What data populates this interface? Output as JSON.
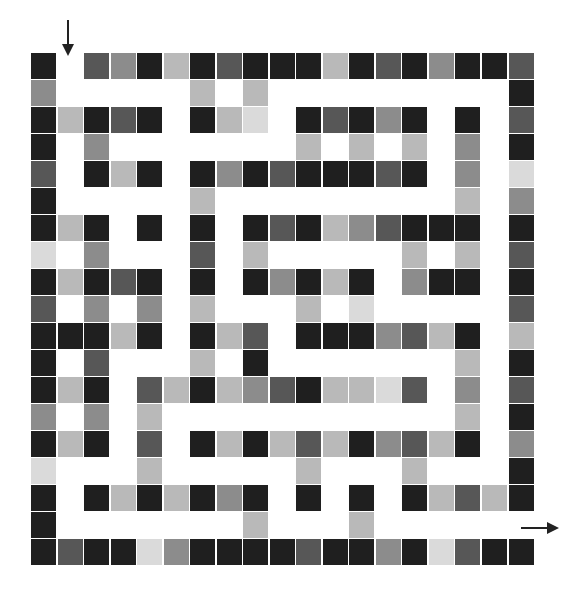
{
  "maze": {
    "rows": 19,
    "cols": 19,
    "palette": {
      "0": "#ffffff",
      "1": "#1f1f1f",
      "2": "#575757",
      "3": "#8c8c8c",
      "4": "#b9b9b9",
      "5": "#dadada"
    },
    "grid": [
      [
        1,
        0,
        2,
        3,
        1,
        4,
        1,
        2,
        1,
        1,
        1,
        4,
        1,
        2,
        1,
        3,
        1,
        1,
        2
      ],
      [
        3,
        0,
        0,
        0,
        0,
        0,
        4,
        0,
        4,
        0,
        0,
        0,
        0,
        0,
        0,
        0,
        0,
        0,
        1
      ],
      [
        1,
        4,
        1,
        2,
        1,
        0,
        1,
        4,
        5,
        0,
        1,
        2,
        1,
        3,
        1,
        0,
        1,
        0,
        2
      ],
      [
        1,
        0,
        3,
        0,
        0,
        0,
        0,
        0,
        0,
        0,
        4,
        0,
        4,
        0,
        4,
        0,
        3,
        0,
        1
      ],
      [
        2,
        0,
        1,
        4,
        1,
        0,
        1,
        3,
        1,
        2,
        1,
        1,
        1,
        2,
        1,
        0,
        3,
        0,
        5
      ],
      [
        1,
        0,
        0,
        0,
        0,
        0,
        4,
        0,
        0,
        0,
        0,
        0,
        0,
        0,
        0,
        0,
        4,
        0,
        3
      ],
      [
        1,
        4,
        1,
        0,
        1,
        0,
        1,
        0,
        1,
        2,
        1,
        4,
        3,
        2,
        1,
        1,
        1,
        0,
        1
      ],
      [
        5,
        0,
        3,
        0,
        0,
        0,
        2,
        0,
        4,
        0,
        0,
        0,
        0,
        0,
        4,
        0,
        4,
        0,
        2
      ],
      [
        1,
        4,
        1,
        2,
        1,
        0,
        1,
        0,
        1,
        3,
        1,
        4,
        1,
        0,
        3,
        1,
        1,
        0,
        1
      ],
      [
        2,
        0,
        3,
        0,
        3,
        0,
        4,
        0,
        0,
        0,
        4,
        0,
        5,
        0,
        0,
        0,
        0,
        0,
        2
      ],
      [
        1,
        1,
        1,
        4,
        1,
        0,
        1,
        4,
        2,
        0,
        1,
        1,
        1,
        3,
        2,
        4,
        1,
        0,
        4
      ],
      [
        1,
        0,
        2,
        0,
        0,
        0,
        4,
        0,
        1,
        0,
        0,
        0,
        0,
        0,
        0,
        0,
        4,
        0,
        1
      ],
      [
        1,
        4,
        1,
        0,
        2,
        4,
        1,
        4,
        3,
        2,
        1,
        4,
        4,
        5,
        2,
        0,
        3,
        0,
        2
      ],
      [
        3,
        0,
        3,
        0,
        4,
        0,
        0,
        0,
        0,
        0,
        0,
        0,
        0,
        0,
        0,
        0,
        4,
        0,
        1
      ],
      [
        1,
        4,
        1,
        0,
        2,
        0,
        1,
        4,
        1,
        4,
        2,
        4,
        1,
        3,
        2,
        4,
        1,
        0,
        3
      ],
      [
        5,
        0,
        0,
        0,
        4,
        0,
        0,
        0,
        0,
        0,
        4,
        0,
        0,
        0,
        4,
        0,
        0,
        0,
        1
      ],
      [
        1,
        0,
        1,
        4,
        1,
        4,
        1,
        3,
        1,
        0,
        1,
        0,
        1,
        0,
        1,
        4,
        2,
        4,
        1
      ],
      [
        1,
        0,
        0,
        0,
        0,
        0,
        0,
        0,
        4,
        0,
        0,
        0,
        4,
        0,
        0,
        0,
        0,
        0,
        0
      ],
      [
        1,
        2,
        1,
        1,
        5,
        3,
        1,
        1,
        1,
        1,
        2,
        1,
        1,
        3,
        1,
        5,
        2,
        1,
        1
      ]
    ],
    "entrance": {
      "row": 0,
      "col": 1,
      "arrow": "down"
    },
    "exit": {
      "row": 17,
      "col": 18,
      "arrow": "right"
    },
    "arrow_color": "#222222"
  }
}
